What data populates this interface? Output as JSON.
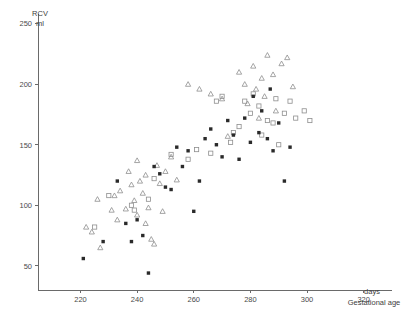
{
  "chart_data": {
    "type": "scatter",
    "title": "",
    "ylabel": "RCV",
    "yunit": "ml",
    "xlabel": "Gestational age",
    "xunit": "days",
    "xlim": [
      205,
      330
    ],
    "ylim": [
      30,
      258
    ],
    "xticks": [
      220,
      240,
      260,
      280,
      300,
      320
    ],
    "yticks": [
      50,
      100,
      150,
      200,
      250
    ],
    "grid": false,
    "legend": "none",
    "series": [
      {
        "name": "open-triangle",
        "marker": "triangle-open",
        "points": [
          [
            222,
            82
          ],
          [
            224,
            78
          ],
          [
            226,
            105
          ],
          [
            227,
            65
          ],
          [
            231,
            96
          ],
          [
            232,
            108
          ],
          [
            233,
            88
          ],
          [
            234,
            112
          ],
          [
            236,
            97
          ],
          [
            237,
            128
          ],
          [
            238,
            117
          ],
          [
            239,
            104
          ],
          [
            240,
            137
          ],
          [
            240,
            92
          ],
          [
            241,
            120
          ],
          [
            242,
            110
          ],
          [
            243,
            125
          ],
          [
            243,
            85
          ],
          [
            244,
            98
          ],
          [
            245,
            72
          ],
          [
            246,
            68
          ],
          [
            247,
            133
          ],
          [
            248,
            118
          ],
          [
            249,
            95
          ],
          [
            250,
            128
          ],
          [
            252,
            140
          ],
          [
            254,
            121
          ],
          [
            258,
            200
          ],
          [
            262,
            196
          ],
          [
            266,
            192
          ],
          [
            270,
            188
          ],
          [
            272,
            157
          ],
          [
            276,
            210
          ],
          [
            278,
            200
          ],
          [
            279,
            184
          ],
          [
            281,
            215
          ],
          [
            282,
            196
          ],
          [
            283,
            172
          ],
          [
            284,
            205
          ],
          [
            285,
            190
          ],
          [
            286,
            224
          ],
          [
            288,
            208
          ],
          [
            289,
            178
          ],
          [
            291,
            217
          ],
          [
            293,
            222
          ],
          [
            295,
            198
          ]
        ]
      },
      {
        "name": "open-square",
        "marker": "square-open",
        "points": [
          [
            225,
            82
          ],
          [
            230,
            108
          ],
          [
            238,
            100
          ],
          [
            239,
            96
          ],
          [
            244,
            105
          ],
          [
            246,
            122
          ],
          [
            252,
            142
          ],
          [
            258,
            138
          ],
          [
            261,
            146
          ],
          [
            266,
            143
          ],
          [
            268,
            186
          ],
          [
            270,
            190
          ],
          [
            273,
            152
          ],
          [
            274,
            160
          ],
          [
            276,
            165
          ],
          [
            278,
            186
          ],
          [
            280,
            176
          ],
          [
            281,
            192
          ],
          [
            283,
            182
          ],
          [
            284,
            158
          ],
          [
            286,
            170
          ],
          [
            288,
            168
          ],
          [
            289,
            188
          ],
          [
            290,
            150
          ],
          [
            292,
            176
          ],
          [
            294,
            186
          ],
          [
            296,
            172
          ],
          [
            299,
            178
          ],
          [
            301,
            170
          ]
        ]
      },
      {
        "name": "filled-square",
        "marker": "square-filled",
        "points": [
          [
            221,
            56
          ],
          [
            228,
            70
          ],
          [
            233,
            120
          ],
          [
            236,
            85
          ],
          [
            238,
            70
          ],
          [
            240,
            88
          ],
          [
            242,
            75
          ],
          [
            244,
            44
          ],
          [
            246,
            132
          ],
          [
            248,
            126
          ],
          [
            250,
            115
          ],
          [
            252,
            113
          ],
          [
            254,
            148
          ],
          [
            256,
            132
          ],
          [
            258,
            145
          ],
          [
            260,
            95
          ],
          [
            262,
            120
          ],
          [
            264,
            155
          ],
          [
            266,
            163
          ],
          [
            268,
            150
          ],
          [
            270,
            140
          ],
          [
            272,
            170
          ],
          [
            274,
            158
          ],
          [
            276,
            138
          ],
          [
            278,
            172
          ],
          [
            280,
            152
          ],
          [
            281,
            190
          ],
          [
            283,
            160
          ],
          [
            284,
            178
          ],
          [
            286,
            155
          ],
          [
            287,
            196
          ],
          [
            288,
            145
          ],
          [
            290,
            168
          ],
          [
            292,
            120
          ],
          [
            294,
            148
          ]
        ]
      }
    ]
  },
  "axes": {
    "y_title_line1": "RCV",
    "y_title_line2": "ml",
    "x_title_line1": "days",
    "x_title_line2": "Gestational age",
    "ytick_labels": [
      "250",
      "200",
      "150",
      "100",
      "50"
    ],
    "xtick_labels": [
      "220",
      "240",
      "260",
      "280",
      "300",
      "320"
    ]
  },
  "colors": {
    "axis": "#6a6a6a",
    "open_marker": "#8e8e8e",
    "filled_marker": "#2a2a2a",
    "text": "#3d3d3d",
    "background": "#ffffff"
  }
}
